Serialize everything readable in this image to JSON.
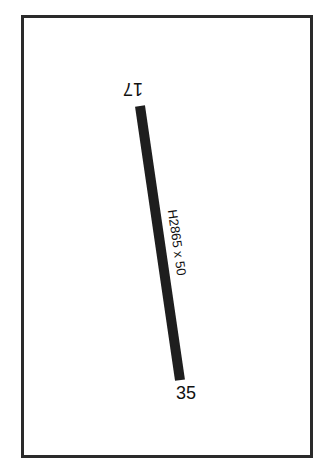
{
  "diagram": {
    "type": "airport-runway-diagram",
    "runway": {
      "ends": [
        {
          "id": "17",
          "position": "north"
        },
        {
          "id": "35",
          "position": "south"
        }
      ],
      "dimensions_label": "H2865 x 50",
      "color": "#1e1e1e"
    },
    "frame_color": "#2a2a2a",
    "background": "#ffffff"
  }
}
